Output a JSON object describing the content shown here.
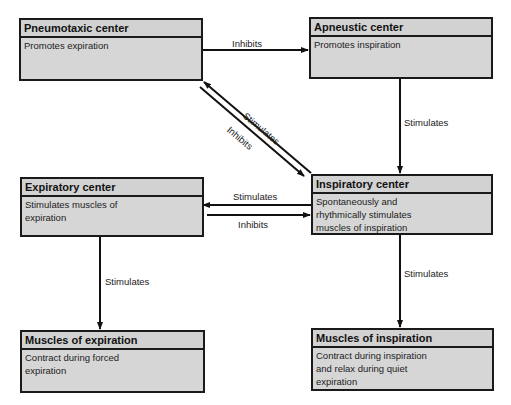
{
  "nodes": {
    "pneumotaxic": {
      "title": "Pneumotaxic    center",
      "description": "Promotes expiration"
    },
    "apneustic": {
      "title": "Apneustic    center",
      "description": "Promotes inspiration"
    },
    "expiratory": {
      "title": "Expiratory    center",
      "description": "Stimulates muscles of\nexpiration"
    },
    "inspiratory": {
      "title": "Inspiratory    center",
      "description": "Spontaneously and\nrhythmically stimulates\nmuscles of inspiration"
    },
    "muscles_expiration": {
      "title": "Muscles  of  expiration",
      "description": "Contract during forced\nexpiration"
    },
    "muscles_inspiration": {
      "title": "Muscles  of  inspiration",
      "description": "Contract during inspiration\nand relax during quiet\nexpiration"
    }
  },
  "edges": [
    {
      "from": "pneumotaxic",
      "to": "apneustic",
      "label": "Inhibits"
    },
    {
      "from": "inspiratory",
      "to": "pneumotaxic",
      "label": "Stimulates"
    },
    {
      "from": "pneumotaxic",
      "to": "inspiratory",
      "label": "Inhibits"
    },
    {
      "from": "apneustic",
      "to": "inspiratory",
      "label": "Stimulates"
    },
    {
      "from": "inspiratory",
      "to": "expiratory",
      "label": "Stimulates"
    },
    {
      "from": "expiratory",
      "to": "inspiratory",
      "label": "Inhibits"
    },
    {
      "from": "expiratory",
      "to": "muscles_expiration",
      "label": "Stimulates"
    },
    {
      "from": "inspiratory",
      "to": "muscles_inspiration",
      "label": "Stimulates"
    }
  ],
  "colors": {
    "box_fill": "#d6d6d6",
    "stroke": "#1a1a1a",
    "background": "#ffffff"
  }
}
